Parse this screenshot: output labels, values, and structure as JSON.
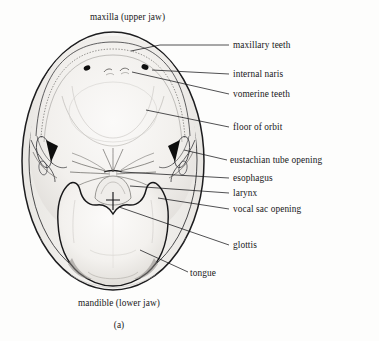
{
  "figure": {
    "panel_letter": "(a)",
    "top_label": "maxilla (upper jaw)",
    "bottom_label": "mandible (lower jaw)"
  },
  "labels": {
    "maxilla_upper_jaw": "maxilla (upper jaw)",
    "maxillary_teeth": "maxillary teeth",
    "internal_naris": "internal naris",
    "vomerine_teeth": "vomerine teeth",
    "floor_of_orbit": "floor of orbit",
    "eustachian_tube_opening": "eustachian tube opening",
    "esophagus": "esophagus",
    "larynx": "larynx",
    "vocal_sac_opening": "vocal sac opening",
    "glottis": "glottis",
    "tongue": "tongue",
    "mandible_lower_jaw": "mandible (lower jaw)",
    "panel_letter": "(a)"
  },
  "colors": {
    "background": "#fdfdfc",
    "ink": "#17171a",
    "line": "#2a2a2c",
    "fill_light": "#f6f5f3",
    "fill_shadow": "#d8d6d2",
    "solid_black": "#101010"
  },
  "structures": [
    {
      "name": "maxilla (upper jaw)",
      "kind": "outline",
      "position": "outer oval rim"
    },
    {
      "name": "maxillary teeth",
      "kind": "ridge",
      "position": "inner arc along upper rim"
    },
    {
      "name": "internal naris",
      "kind": "opening",
      "count": 2,
      "position": "upper palate, paired"
    },
    {
      "name": "vomerine teeth",
      "kind": "tooth-patch",
      "count": 2,
      "position": "midline between nares"
    },
    {
      "name": "floor of orbit",
      "kind": "surface",
      "position": "broad upper palate bulge"
    },
    {
      "name": "eustachian tube opening",
      "kind": "opening",
      "count": 2,
      "position": "lateral, at jaw angle"
    },
    {
      "name": "esophagus",
      "kind": "opening",
      "position": "midline posterior, radiating folds"
    },
    {
      "name": "larynx",
      "kind": "mound",
      "position": "midline above tongue notch"
    },
    {
      "name": "vocal sac opening",
      "kind": "slit",
      "count": 2,
      "position": "lateral floor of mouth"
    },
    {
      "name": "glottis",
      "kind": "slit",
      "position": "midline on larynx"
    },
    {
      "name": "tongue",
      "kind": "bilobed-body",
      "position": "lower mouth floor, attached anteriorly"
    },
    {
      "name": "mandible (lower jaw)",
      "kind": "outline",
      "position": "lower oval rim"
    }
  ]
}
